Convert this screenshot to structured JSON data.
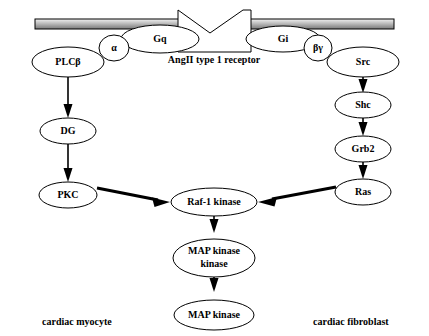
{
  "diagram": {
    "membrane": {
      "name": "plasma-membrane",
      "color_light": "#f2f2f2",
      "color_mid": "#b0b0b0",
      "color_dark": "#7a7a7a",
      "stroke": "#000000"
    },
    "receptor": {
      "label": "AngII type 1 receptor",
      "shape": "notched-rectangle"
    },
    "cell_labels": {
      "left": "cardiac myocyte",
      "right": "cardiac fibroblast"
    },
    "nodes": [
      {
        "id": "plcb",
        "label": "PLCβ",
        "x": 68,
        "y": 62,
        "rx": 36,
        "ry": 15,
        "lines": [
          "PLCβ"
        ]
      },
      {
        "id": "alpha",
        "label": "α",
        "x": 114,
        "y": 48,
        "rx": 15,
        "ry": 13,
        "lines": [
          "α"
        ]
      },
      {
        "id": "gq",
        "label": "Gq",
        "x": 160,
        "y": 39,
        "rx": 39,
        "ry": 14,
        "lines": [
          "Gq"
        ]
      },
      {
        "id": "gi",
        "label": "Gi",
        "x": 283,
        "y": 39,
        "rx": 37,
        "ry": 13,
        "lines": [
          "Gi"
        ]
      },
      {
        "id": "betagamma",
        "label": "βγ",
        "x": 318,
        "y": 48,
        "rx": 14,
        "ry": 13,
        "lines": [
          "βγ"
        ]
      },
      {
        "id": "src",
        "label": "Src",
        "x": 363,
        "y": 62,
        "rx": 36,
        "ry": 15,
        "lines": [
          "Src"
        ]
      },
      {
        "id": "dg",
        "label": "DG",
        "x": 68,
        "y": 131,
        "rx": 28,
        "ry": 13,
        "lines": [
          "DG"
        ]
      },
      {
        "id": "shc",
        "label": "Shc",
        "x": 363,
        "y": 105,
        "rx": 28,
        "ry": 13,
        "lines": [
          "Shc"
        ]
      },
      {
        "id": "pkc",
        "label": "PKC",
        "x": 68,
        "y": 195,
        "rx": 29,
        "ry": 13,
        "lines": [
          "PKC"
        ]
      },
      {
        "id": "grb2",
        "label": "Grb2",
        "x": 363,
        "y": 149,
        "rx": 28,
        "ry": 13,
        "lines": [
          "Grb2"
        ]
      },
      {
        "id": "ras",
        "label": "Ras",
        "x": 363,
        "y": 192,
        "rx": 28,
        "ry": 13,
        "lines": [
          "Ras"
        ]
      },
      {
        "id": "raf1",
        "label": "Raf-1 kinase",
        "x": 214,
        "y": 202,
        "rx": 43,
        "ry": 14,
        "lines": [
          "Raf-1 kinase"
        ]
      },
      {
        "id": "mapkk",
        "label": "MAP kinase kinase",
        "x": 214,
        "y": 258,
        "rx": 41,
        "ry": 19,
        "lines": [
          "MAP kinase",
          "kinase"
        ]
      },
      {
        "id": "mapk",
        "label": "MAP kinase",
        "x": 214,
        "y": 315,
        "rx": 40,
        "ry": 15,
        "lines": [
          "MAP kinase"
        ]
      }
    ],
    "edges": [
      {
        "id": "plcb-dg",
        "from": "PLCβ",
        "to": "DG",
        "style": "thin"
      },
      {
        "id": "dg-pkc",
        "from": "DG",
        "to": "PKC",
        "style": "thin"
      },
      {
        "id": "src-shc",
        "from": "Src",
        "to": "Shc",
        "style": "thin"
      },
      {
        "id": "shc-grb2",
        "from": "Shc",
        "to": "Grb2",
        "style": "thin"
      },
      {
        "id": "grb2-ras",
        "from": "Grb2",
        "to": "Ras",
        "style": "thin"
      },
      {
        "id": "pkc-raf1",
        "from": "PKC",
        "to": "Raf-1 kinase",
        "style": "thick"
      },
      {
        "id": "ras-raf1",
        "from": "Ras",
        "to": "Raf-1 kinase",
        "style": "thick"
      },
      {
        "id": "raf1-mapkk",
        "from": "Raf-1 kinase",
        "to": "MAP kinase kinase",
        "style": "thin"
      },
      {
        "id": "mapkk-mapk",
        "from": "MAP kinase kinase",
        "to": "MAP kinase",
        "style": "thin"
      }
    ]
  }
}
